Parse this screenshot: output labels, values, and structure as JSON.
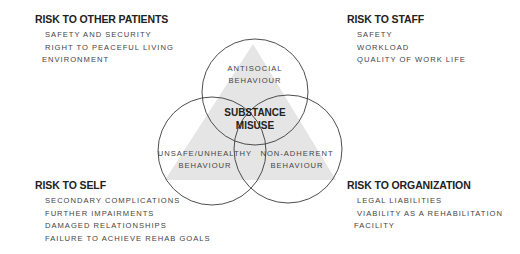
{
  "diagram": {
    "center": {
      "line1": "SUBSTANCE",
      "line2": "MISUSE"
    },
    "circles": [
      {
        "id": "top",
        "line1": "ANTISOCIAL",
        "line2": "BEHAVIOUR"
      },
      {
        "id": "left",
        "line1": "UNSAFE/UNHEALTHY",
        "line2": "BEHAVIOUR"
      },
      {
        "id": "right",
        "line1": "NON-ADHERENT",
        "line2": "BEHAVIOUR"
      }
    ],
    "colors": {
      "triangle_fill": "#e5e5e5",
      "circle_stroke": "#3a3a3a",
      "background": "#ffffff"
    }
  },
  "risks": {
    "other_patients": {
      "title": "RISK TO OTHER PATIENTS",
      "items": [
        "SAFETY AND SECURITY",
        "RIGHT TO PEACEFUL LIVING",
        "ENVIRONMENT"
      ]
    },
    "staff": {
      "title": "RISK TO STAFF",
      "items": [
        "SAFETY",
        "WORKLOAD",
        "QUALITY OF WORK LIFE"
      ]
    },
    "self": {
      "title": "RISK TO SELF",
      "items": [
        "SECONDARY COMPLICATIONS",
        "FURTHER IMPAIRMENTS",
        "DAMAGED RELATIONSHIPS",
        "FAILURE TO ACHIEVE REHAB GOALS"
      ]
    },
    "organization": {
      "title": "RISK TO ORGANIZATION",
      "items": [
        "LEGAL LIABILITIES",
        "VIABILITY AS A REHABILITATION",
        "FACILITY"
      ]
    }
  }
}
